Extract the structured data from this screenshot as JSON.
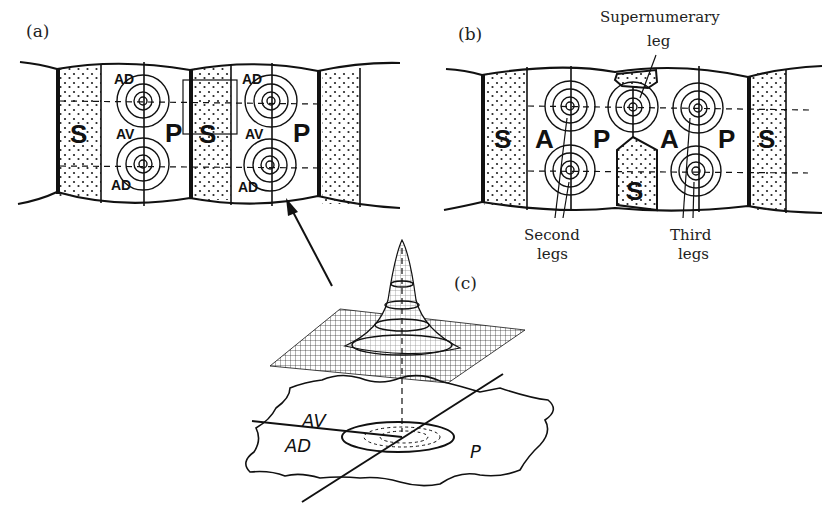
{
  "figure": {
    "panels": [
      {
        "id": "a",
        "label": "(a)",
        "segments": [
          {
            "regions": [
              "S",
              "AV",
              "P"
            ],
            "sublabels": [
              "AD",
              "AV",
              "AD"
            ]
          },
          {
            "regions": [
              "S",
              "AV",
              "P"
            ],
            "sublabels": [
              "AD",
              "AV",
              "AD"
            ]
          }
        ]
      },
      {
        "id": "b",
        "label": "(b)",
        "regions": [
          "S",
          "A",
          "P",
          "S",
          "A",
          "P",
          "S"
        ],
        "annotations": {
          "supernumerary": "Supernumerary",
          "supernumerary_2": "leg",
          "second": "Second",
          "second_2": "legs",
          "third": "Third",
          "third_2": "legs"
        }
      },
      {
        "id": "c",
        "label": "(c)",
        "plane_labels": {
          "av": "AV",
          "ad": "AD",
          "p": "P"
        }
      }
    ]
  },
  "labels": {
    "a": "(a)",
    "b": "(b)",
    "c": "(c)",
    "S": "S",
    "P": "P",
    "A": "A",
    "AV": "AV",
    "AD": "AD"
  }
}
